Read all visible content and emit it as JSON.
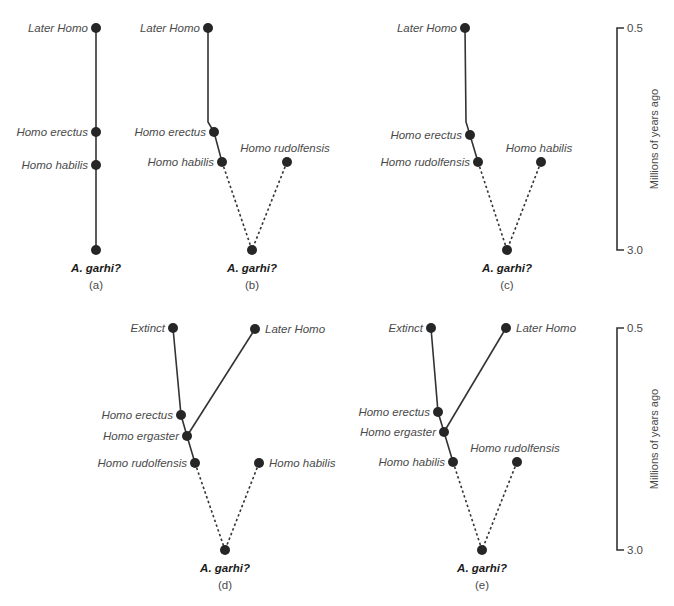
{
  "figure": {
    "panels": [
      {
        "id": "a",
        "caption": "(a)",
        "root_label": "A. garhi?",
        "nodes": [
          {
            "label": "Later Homo",
            "x": 96,
            "y": 28,
            "side": "left"
          },
          {
            "label": "Homo erectus",
            "x": 96,
            "y": 132,
            "side": "left"
          },
          {
            "label": "Homo habilis",
            "x": 96,
            "y": 165,
            "side": "left"
          },
          {
            "label": "",
            "x": 96,
            "y": 250,
            "side": "none"
          }
        ],
        "edges": [
          {
            "points": [
              [
                96,
                28
              ],
              [
                96,
                250
              ]
            ],
            "style": "solid"
          }
        ],
        "root": {
          "x": 96,
          "y": 250
        }
      },
      {
        "id": "b",
        "caption": "(b)",
        "root_label": "A. garhi?",
        "nodes": [
          {
            "label": "Later Homo",
            "x": 208,
            "y": 28,
            "side": "left"
          },
          {
            "label": "Homo erectus",
            "x": 214,
            "y": 132,
            "side": "left"
          },
          {
            "label": "Homo habilis",
            "x": 222,
            "y": 162,
            "side": "left"
          },
          {
            "label": "Homo rudolfensis",
            "x": 287,
            "y": 162,
            "side": "above-right"
          },
          {
            "label": "",
            "x": 252,
            "y": 250,
            "side": "none"
          }
        ],
        "edges": [
          {
            "points": [
              [
                208,
                28
              ],
              [
                208,
                122
              ],
              [
                214,
                132
              ],
              [
                222,
                162
              ]
            ],
            "style": "solid"
          },
          {
            "points": [
              [
                222,
                162
              ],
              [
                252,
                250
              ]
            ],
            "style": "dashed"
          },
          {
            "points": [
              [
                287,
                162
              ],
              [
                252,
                250
              ]
            ],
            "style": "dashed"
          }
        ],
        "root": {
          "x": 252,
          "y": 250
        }
      },
      {
        "id": "c",
        "caption": "(c)",
        "root_label": "A. garhi?",
        "nodes": [
          {
            "label": "Later Homo",
            "x": 465,
            "y": 28,
            "side": "left"
          },
          {
            "label": "Homo erectus",
            "x": 470,
            "y": 135,
            "side": "left"
          },
          {
            "label": "Homo rudolfensis",
            "x": 478,
            "y": 162,
            "side": "left"
          },
          {
            "label": "Homo habilis",
            "x": 541,
            "y": 162,
            "side": "above-right"
          },
          {
            "label": "",
            "x": 507,
            "y": 250,
            "side": "none"
          }
        ],
        "edges": [
          {
            "points": [
              [
                465,
                28
              ],
              [
                466,
                122
              ],
              [
                470,
                135
              ],
              [
                478,
                162
              ]
            ],
            "style": "solid"
          },
          {
            "points": [
              [
                478,
                162
              ],
              [
                507,
                250
              ]
            ],
            "style": "dashed"
          },
          {
            "points": [
              [
                541,
                162
              ],
              [
                507,
                250
              ]
            ],
            "style": "dashed"
          }
        ],
        "root": {
          "x": 507,
          "y": 250
        }
      },
      {
        "id": "d",
        "caption": "(d)",
        "root_label": "A. garhi?",
        "nodes": [
          {
            "label": "Extinct",
            "x": 173,
            "y": 328,
            "side": "left"
          },
          {
            "label": "Later Homo",
            "x": 255,
            "y": 329,
            "side": "right"
          },
          {
            "label": "Homo erectus",
            "x": 181,
            "y": 415,
            "side": "left"
          },
          {
            "label": "Homo ergaster",
            "x": 187,
            "y": 436,
            "side": "left"
          },
          {
            "label": "Homo rudolfensis",
            "x": 195,
            "y": 463,
            "side": "left"
          },
          {
            "label": "Homo habilis",
            "x": 259,
            "y": 463,
            "side": "right"
          },
          {
            "label": "",
            "x": 225,
            "y": 550,
            "side": "none"
          }
        ],
        "edges": [
          {
            "points": [
              [
                173,
                328
              ],
              [
                181,
                415
              ],
              [
                187,
                436
              ],
              [
                195,
                463
              ]
            ],
            "style": "solid"
          },
          {
            "points": [
              [
                187,
                436
              ],
              [
                255,
                329
              ]
            ],
            "style": "solid"
          },
          {
            "points": [
              [
                195,
                463
              ],
              [
                225,
                550
              ]
            ],
            "style": "dashed"
          },
          {
            "points": [
              [
                259,
                463
              ],
              [
                225,
                550
              ]
            ],
            "style": "dashed"
          }
        ],
        "root": {
          "x": 225,
          "y": 550
        }
      },
      {
        "id": "e",
        "caption": "(e)",
        "root_label": "A. garhi?",
        "nodes": [
          {
            "label": "Extinct",
            "x": 431,
            "y": 328,
            "side": "left"
          },
          {
            "label": "Later Homo",
            "x": 506,
            "y": 328,
            "side": "right"
          },
          {
            "label": "Homo erectus",
            "x": 438,
            "y": 412,
            "side": "left"
          },
          {
            "label": "Homo ergaster",
            "x": 444,
            "y": 432,
            "side": "left"
          },
          {
            "label": "Homo habilis",
            "x": 453,
            "y": 462,
            "side": "left"
          },
          {
            "label": "Homo rudolfensis",
            "x": 517,
            "y": 462,
            "side": "above-right"
          },
          {
            "label": "",
            "x": 482,
            "y": 550,
            "side": "none"
          }
        ],
        "edges": [
          {
            "points": [
              [
                431,
                328
              ],
              [
                438,
                412
              ],
              [
                444,
                432
              ],
              [
                453,
                462
              ]
            ],
            "style": "solid"
          },
          {
            "points": [
              [
                444,
                432
              ],
              [
                506,
                328
              ]
            ],
            "style": "solid"
          },
          {
            "points": [
              [
                453,
                462
              ],
              [
                482,
                550
              ]
            ],
            "style": "dashed"
          },
          {
            "points": [
              [
                517,
                462
              ],
              [
                482,
                550
              ]
            ],
            "style": "dashed"
          }
        ],
        "root": {
          "x": 482,
          "y": 550
        }
      }
    ],
    "scales": [
      {
        "x": 617,
        "top": 28,
        "bottom": 250,
        "top_label": "0.5",
        "bottom_label": "3.0",
        "axis_label": "Millions of years ago"
      },
      {
        "x": 617,
        "top": 328,
        "bottom": 550,
        "top_label": "0.5",
        "bottom_label": "3.0",
        "axis_label": "Millions of years ago"
      }
    ],
    "colors": {
      "line": "#333333",
      "node": "#262626",
      "text": "#4a4a4a",
      "root_text": "#1a1a1a"
    }
  }
}
